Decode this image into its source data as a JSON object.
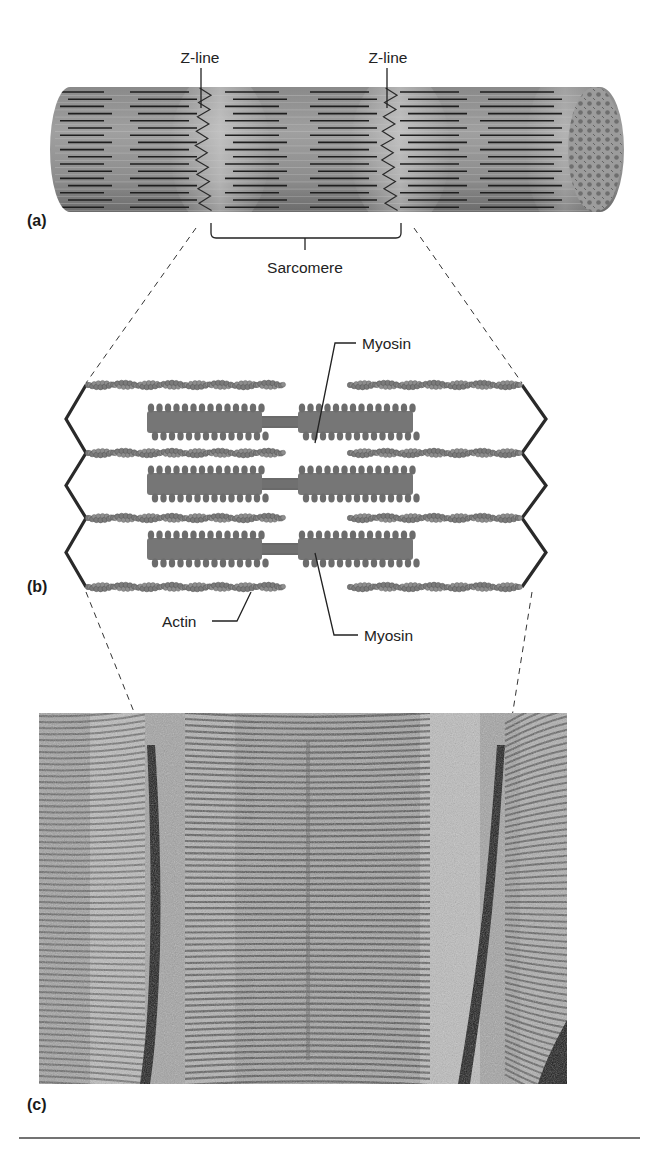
{
  "figure": {
    "panels": [
      {
        "id": "a",
        "label": "(a)",
        "description": "Muscle fibril cylinder with striations"
      },
      {
        "id": "b",
        "label": "(b)",
        "description": "Sarcomere schematic of thick and thin filaments"
      },
      {
        "id": "c",
        "label": "(c)",
        "description": "Electron micrograph of a sarcomere"
      }
    ],
    "labels": {
      "z_line_left": "Z-line",
      "z_line_right": "Z-line",
      "sarcomere": "Sarcomere",
      "myosin_top": "Myosin",
      "myosin_bottom": "Myosin",
      "actin": "Actin"
    },
    "colors": {
      "fiber_dark": "#6f6f6f",
      "fiber_light": "#a9a9a9",
      "filament_line": "#1e1e1e",
      "actin": "#7a7a7a",
      "myosin": "#6a6a6a",
      "zline": "#2a2a2a",
      "micrograph_bg": "#9a9a9a"
    }
  }
}
